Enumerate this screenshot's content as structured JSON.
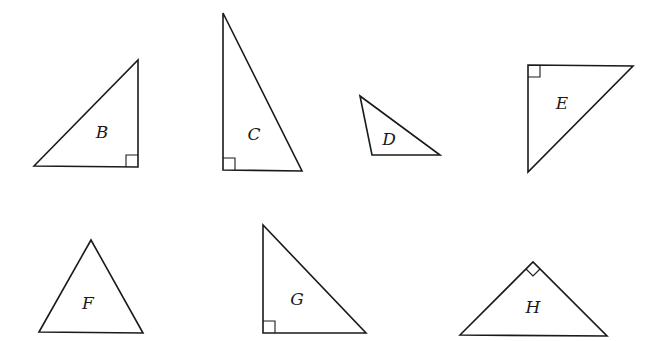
{
  "diagram": {
    "stroke_color": "#1a1a1a",
    "background": "#ffffff",
    "triangles": [
      {
        "label": "B",
        "points": "34,166 138,60 138,167",
        "right_angle": "bottom-right",
        "label_pos": [
          102,
          138
        ]
      },
      {
        "label": "C",
        "points": "223,13 223,170 302,171",
        "right_angle": "bottom-left",
        "label_pos": [
          254,
          140
        ]
      },
      {
        "label": "D",
        "points": "360,96 372,155 440,155",
        "right_angle": null,
        "label_pos": [
          388,
          142
        ]
      },
      {
        "label": "E",
        "points": "528,65 633,66 528,172",
        "right_angle": "top-left",
        "label_pos": [
          562,
          108
        ]
      },
      {
        "label": "F",
        "points": "39,332 91,240 143,333",
        "right_angle": null,
        "label_pos": [
          89,
          309
        ]
      },
      {
        "label": "G",
        "points": "263,225 263,333 366,333",
        "right_angle": "bottom-left",
        "label_pos": [
          297,
          305
        ]
      },
      {
        "label": "H",
        "points": "460,335 533,262 607,336",
        "right_angle": "apex",
        "label_pos": [
          533,
          312
        ]
      }
    ]
  }
}
